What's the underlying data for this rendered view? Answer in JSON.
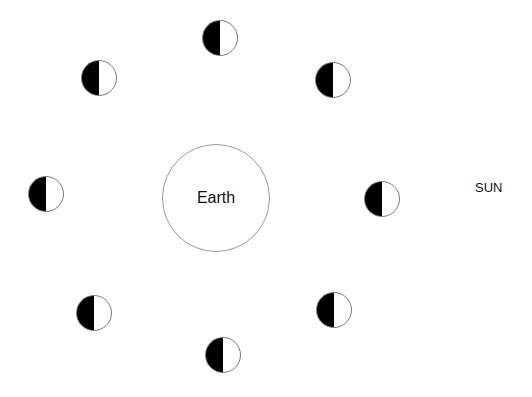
{
  "diagram": {
    "earth": {
      "label": "Earth",
      "cx": 216,
      "cy": 198,
      "r": 54
    },
    "sun": {
      "label": "SUN",
      "x": 475,
      "y": 180
    },
    "moon_phase_fill": {
      "dark_side": "left",
      "dark_color": "#000000",
      "light_color": "#ffffff"
    },
    "moons": [
      {
        "position": "top",
        "cx": 220,
        "cy": 38
      },
      {
        "position": "upper-left",
        "cx": 99,
        "cy": 78
      },
      {
        "position": "upper-right",
        "cx": 333,
        "cy": 80
      },
      {
        "position": "left",
        "cx": 46,
        "cy": 194
      },
      {
        "position": "right",
        "cx": 382,
        "cy": 199
      },
      {
        "position": "lower-left",
        "cx": 94,
        "cy": 313
      },
      {
        "position": "lower-right",
        "cx": 334,
        "cy": 310
      },
      {
        "position": "bottom",
        "cx": 223,
        "cy": 355
      }
    ]
  }
}
